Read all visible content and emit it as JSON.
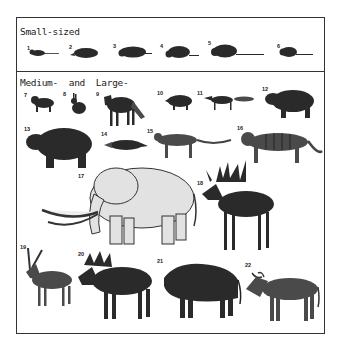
{
  "figure": {
    "sections": [
      {
        "title": "Small-sized",
        "animals": [
          {
            "num": "1"
          },
          {
            "num": "2"
          },
          {
            "num": "3"
          },
          {
            "num": "4"
          },
          {
            "num": "5"
          },
          {
            "num": "6"
          }
        ]
      },
      {
        "title": "Medium-  and  Large-",
        "animals": [
          {
            "num": "7"
          },
          {
            "num": "8"
          },
          {
            "num": "9"
          },
          {
            "num": "10"
          },
          {
            "num": "11"
          },
          {
            "num": "12"
          },
          {
            "num": "13"
          },
          {
            "num": "14"
          },
          {
            "num": "15"
          },
          {
            "num": "16"
          },
          {
            "num": "17"
          },
          {
            "num": "18"
          },
          {
            "num": "19"
          },
          {
            "num": "20"
          },
          {
            "num": "21"
          },
          {
            "num": "22"
          }
        ]
      }
    ]
  }
}
